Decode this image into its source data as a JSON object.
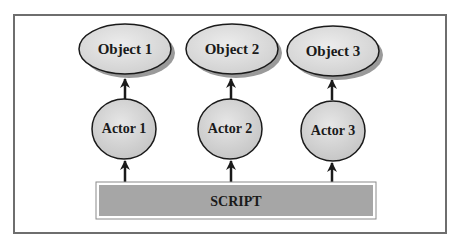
{
  "diagram": {
    "objects": [
      {
        "label": "Object 1"
      },
      {
        "label": "Object 2"
      },
      {
        "label": "Object 3"
      }
    ],
    "actors": [
      {
        "label": "Actor 1"
      },
      {
        "label": "Actor 2"
      },
      {
        "label": "Actor 3"
      }
    ],
    "script": {
      "label": "SCRIPT"
    },
    "edges": [
      {
        "from": "SCRIPT",
        "to": "Actor 1"
      },
      {
        "from": "SCRIPT",
        "to": "Actor 2"
      },
      {
        "from": "SCRIPT",
        "to": "Actor 3"
      },
      {
        "from": "Actor 1",
        "to": "Object 1"
      },
      {
        "from": "Actor 2",
        "to": "Object 2"
      },
      {
        "from": "Actor 3",
        "to": "Object 3"
      }
    ],
    "colors": {
      "frame": "#6e6e6e",
      "object_fill": "#d9d9d9",
      "actor_fill": "#d3d3d3",
      "script_fill": "#a6a6a6",
      "stroke": "#1a1a1a",
      "shadow": "#9a9a9a"
    }
  }
}
